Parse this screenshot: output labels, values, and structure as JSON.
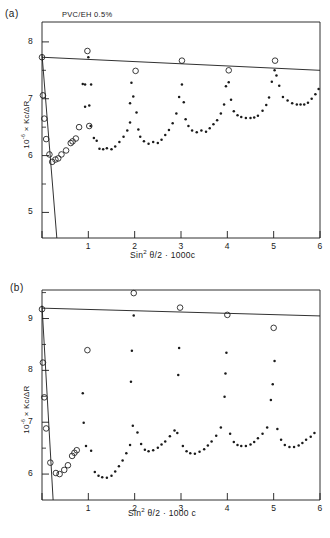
{
  "figure": {
    "panels": [
      {
        "panel_label": "(a)",
        "annotation": "PVC/EH 0.5%"
      },
      {
        "panel_label": "(b)",
        "annotation": ""
      }
    ]
  },
  "chart_data": [
    {
      "type": "scatter",
      "panel": "(a)",
      "title": "",
      "annotation": "PVC/EH 0.5%",
      "xlabel": "Sin² θ/2 + 1000c",
      "ylabel": "10⁻⁶ × Kc/ΔR",
      "xlim": [
        0,
        6
      ],
      "ylim": [
        4.55,
        8.35
      ],
      "xticks": [
        0,
        1,
        2,
        3,
        4,
        5,
        6
      ],
      "xtick_labels": [
        "",
        "1",
        "2",
        "3",
        "4",
        "5",
        "6"
      ],
      "yticks": [
        5,
        6,
        7,
        8
      ],
      "ytick_labels": [
        "5",
        "6",
        "7",
        "8"
      ],
      "yminorticks": [
        4.5,
        5.5,
        6.5,
        7.5
      ],
      "grid": false,
      "legend": "none",
      "series": [
        {
          "name": "zero-angle extrapolation (open circles)",
          "marker": "open-circle",
          "points": [
            [
              0.0,
              7.73
            ],
            [
              0.02,
              7.06
            ],
            [
              0.05,
              6.65
            ],
            [
              0.09,
              6.29
            ],
            [
              0.16,
              6.02
            ],
            [
              0.22,
              5.89
            ],
            [
              0.29,
              5.93
            ],
            [
              0.35,
              5.95
            ],
            [
              0.42,
              6.02
            ],
            [
              0.52,
              6.09
            ],
            [
              0.62,
              6.22
            ],
            [
              0.66,
              6.25
            ],
            [
              0.73,
              6.3
            ],
            [
              0.8,
              6.5
            ],
            [
              0.98,
              7.84
            ],
            [
              1.02,
              6.52
            ],
            [
              2.02,
              7.49
            ],
            [
              3.02,
              7.67
            ],
            [
              4.03,
              7.5
            ],
            [
              5.03,
              7.67
            ]
          ]
        },
        {
          "name": "angular scattering data (filled dots)",
          "marker": "filled-dot",
          "points": [
            [
              1.0,
              7.73
            ],
            [
              1.06,
              7.25
            ],
            [
              1.02,
              6.88
            ],
            [
              1.05,
              6.52
            ],
            [
              1.12,
              6.31
            ],
            [
              1.18,
              6.26
            ],
            [
              1.24,
              6.12
            ],
            [
              1.32,
              6.11
            ],
            [
              1.4,
              6.13
            ],
            [
              1.5,
              6.11
            ],
            [
              1.58,
              6.16
            ],
            [
              1.67,
              6.24
            ],
            [
              1.76,
              6.33
            ],
            [
              1.84,
              6.44
            ],
            [
              1.9,
              6.58
            ],
            [
              0.93,
              7.25
            ],
            [
              0.93,
              6.86
            ],
            [
              0.88,
              7.26
            ],
            [
              1.97,
              7.04
            ],
            [
              2.04,
              6.76
            ],
            [
              2.08,
              6.46
            ],
            [
              2.12,
              6.33
            ],
            [
              2.2,
              6.25
            ],
            [
              2.3,
              6.21
            ],
            [
              2.4,
              6.24
            ],
            [
              2.5,
              6.22
            ],
            [
              2.58,
              6.28
            ],
            [
              2.66,
              6.36
            ],
            [
              2.74,
              6.45
            ],
            [
              2.82,
              6.57
            ],
            [
              2.9,
              6.74
            ],
            [
              2.96,
              7.03
            ],
            [
              1.93,
              7.28
            ],
            [
              1.9,
              6.92
            ],
            [
              3.02,
              7.25
            ],
            [
              3.06,
              6.94
            ],
            [
              3.1,
              6.64
            ],
            [
              3.16,
              6.52
            ],
            [
              3.24,
              6.44
            ],
            [
              3.34,
              6.41
            ],
            [
              3.44,
              6.44
            ],
            [
              3.54,
              6.42
            ],
            [
              3.62,
              6.48
            ],
            [
              3.7,
              6.55
            ],
            [
              3.78,
              6.62
            ],
            [
              3.86,
              6.74
            ],
            [
              3.93,
              6.9
            ],
            [
              3.97,
              7.22
            ],
            [
              4.03,
              7.29
            ],
            [
              4.08,
              6.98
            ],
            [
              4.14,
              6.78
            ],
            [
              4.22,
              6.71
            ],
            [
              4.3,
              6.68
            ],
            [
              4.4,
              6.66
            ],
            [
              4.5,
              6.66
            ],
            [
              4.58,
              6.67
            ],
            [
              4.66,
              6.7
            ],
            [
              4.76,
              6.79
            ],
            [
              4.84,
              6.89
            ],
            [
              4.9,
              7.02
            ],
            [
              4.96,
              7.3
            ],
            [
              5.02,
              7.5
            ],
            [
              5.06,
              7.41
            ],
            [
              5.12,
              7.23
            ],
            [
              5.2,
              7.03
            ],
            [
              5.3,
              6.97
            ],
            [
              5.4,
              6.92
            ],
            [
              5.5,
              6.9
            ],
            [
              5.58,
              6.9
            ],
            [
              5.66,
              6.9
            ],
            [
              5.74,
              6.93
            ],
            [
              5.82,
              7.0
            ],
            [
              5.9,
              7.08
            ],
            [
              5.97,
              7.17
            ]
          ]
        }
      ],
      "fit_line": {
        "name": "zero-concentration line",
        "x": [
          0.0,
          6.0
        ],
        "y": [
          7.73,
          7.5
        ]
      },
      "steep_line": {
        "name": "zero-angle line",
        "x": [
          0.0,
          0.32
        ],
        "y": [
          7.78,
          4.55
        ]
      }
    },
    {
      "type": "scatter",
      "panel": "(b)",
      "title": "",
      "annotation": "",
      "xlabel": "Sin² θ/2 + 1000c",
      "ylabel": "10⁻⁶ × Kc/ΔR",
      "xlim": [
        0,
        6
      ],
      "ylim": [
        5.5,
        9.55
      ],
      "xticks": [
        0,
        1,
        2,
        3,
        4,
        5,
        6
      ],
      "xtick_labels": [
        "",
        "1",
        "2",
        "3",
        "4",
        "5",
        "6"
      ],
      "yticks": [
        6,
        7,
        8,
        9
      ],
      "ytick_labels": [
        "6",
        "7",
        "8",
        "9"
      ],
      "yminorticks": [
        6.5,
        7.5,
        8.5,
        9.5
      ],
      "grid": false,
      "legend": "none",
      "series": [
        {
          "name": "zero-angle extrapolation (open circles)",
          "marker": "open-circle",
          "points": [
            [
              0.0,
              9.18
            ],
            [
              0.02,
              8.15
            ],
            [
              0.05,
              7.48
            ],
            [
              0.09,
              6.88
            ],
            [
              0.18,
              6.22
            ],
            [
              0.3,
              6.02
            ],
            [
              0.38,
              6.0
            ],
            [
              0.48,
              6.08
            ],
            [
              0.56,
              6.17
            ],
            [
              0.65,
              6.35
            ],
            [
              0.7,
              6.41
            ],
            [
              0.75,
              6.46
            ],
            [
              0.98,
              8.39
            ],
            [
              1.98,
              9.49
            ],
            [
              2.98,
              9.21
            ],
            [
              4.0,
              9.07
            ],
            [
              5.0,
              8.82
            ]
          ]
        },
        {
          "name": "angular scattering data (filled dots)",
          "marker": "filled-dot",
          "points": [
            [
              0.88,
              7.56
            ],
            [
              0.9,
              6.99
            ],
            [
              0.95,
              6.54
            ],
            [
              1.06,
              6.45
            ],
            [
              1.14,
              6.04
            ],
            [
              1.22,
              5.97
            ],
            [
              1.3,
              5.94
            ],
            [
              1.4,
              5.93
            ],
            [
              1.5,
              5.97
            ],
            [
              1.58,
              6.05
            ],
            [
              1.66,
              6.15
            ],
            [
              1.74,
              6.26
            ],
            [
              1.82,
              6.4
            ],
            [
              1.9,
              6.56
            ],
            [
              1.96,
              6.93
            ],
            [
              1.92,
              7.78
            ],
            [
              1.94,
              8.38
            ],
            [
              1.98,
              9.06
            ],
            [
              2.06,
              6.8
            ],
            [
              2.14,
              6.58
            ],
            [
              2.22,
              6.47
            ],
            [
              2.3,
              6.44
            ],
            [
              2.4,
              6.46
            ],
            [
              2.5,
              6.51
            ],
            [
              2.58,
              6.57
            ],
            [
              2.66,
              6.63
            ],
            [
              2.76,
              6.73
            ],
            [
              2.86,
              6.84
            ],
            [
              2.94,
              7.91
            ],
            [
              2.96,
              8.43
            ],
            [
              2.92,
              6.79
            ],
            [
              3.04,
              6.54
            ],
            [
              3.12,
              6.44
            ],
            [
              3.2,
              6.4
            ],
            [
              3.3,
              6.39
            ],
            [
              3.4,
              6.43
            ],
            [
              3.5,
              6.48
            ],
            [
              3.58,
              6.55
            ],
            [
              3.66,
              6.63
            ],
            [
              3.76,
              6.74
            ],
            [
              3.86,
              6.9
            ],
            [
              3.94,
              7.49
            ],
            [
              3.96,
              7.94
            ],
            [
              3.98,
              8.34
            ],
            [
              4.06,
              6.78
            ],
            [
              4.14,
              6.62
            ],
            [
              4.22,
              6.56
            ],
            [
              4.3,
              6.54
            ],
            [
              4.4,
              6.54
            ],
            [
              4.5,
              6.57
            ],
            [
              4.58,
              6.62
            ],
            [
              4.66,
              6.69
            ],
            [
              4.76,
              6.78
            ],
            [
              4.86,
              6.9
            ],
            [
              4.94,
              7.43
            ],
            [
              4.98,
              7.73
            ],
            [
              5.02,
              8.18
            ],
            [
              5.08,
              6.87
            ],
            [
              5.16,
              6.66
            ],
            [
              5.24,
              6.56
            ],
            [
              5.34,
              6.52
            ],
            [
              5.44,
              6.52
            ],
            [
              5.54,
              6.55
            ],
            [
              5.62,
              6.6
            ],
            [
              5.7,
              6.66
            ],
            [
              5.8,
              6.72
            ],
            [
              5.88,
              6.79
            ]
          ]
        }
      ],
      "fit_line": {
        "name": "zero-concentration line",
        "x": [
          0.0,
          6.0
        ],
        "y": [
          9.2,
          9.05
        ]
      },
      "steep_line": {
        "name": "zero-angle line",
        "x": [
          0.0,
          0.24
        ],
        "y": [
          9.25,
          5.5
        ]
      }
    }
  ]
}
